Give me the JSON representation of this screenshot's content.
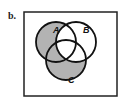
{
  "figure": {
    "label": "b.",
    "shaded_color": "#b3b3b3",
    "line_color": "#111111",
    "sets": [
      {
        "name": "A",
        "cx": 56,
        "cy": 42,
        "r": 20
      },
      {
        "name": "B",
        "cx": 76,
        "cy": 42,
        "r": 20
      },
      {
        "name": "C",
        "cx": 66,
        "cy": 60,
        "r": 20
      }
    ],
    "shaded_regions": [
      "A only",
      "C only",
      "A∩C only"
    ],
    "unshaded_regions": [
      "B only",
      "A∩B only",
      "B∩C only",
      "A∩B∩C"
    ]
  }
}
